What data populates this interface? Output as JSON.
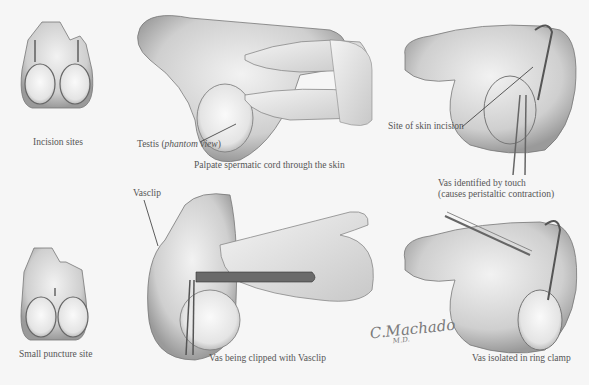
{
  "figure": {
    "panels": [
      {
        "id": "incision-sites",
        "caption": "Incision sites"
      },
      {
        "id": "palpate",
        "caption": "Palpate spermatic cord through the skin",
        "callout": {
          "text_prefix": "Testis (",
          "text_italic": "phantom view",
          "text_suffix": ")"
        }
      },
      {
        "id": "vas-identified",
        "caption_line1": "Vas identified by touch",
        "caption_line2": "(causes peristaltic contraction)",
        "callout": "Site of skin incision"
      },
      {
        "id": "small-puncture",
        "caption": "Small puncture site"
      },
      {
        "id": "vas-clipped",
        "caption": "Vas being clipped with Vasclip",
        "callout": "Vasclip"
      },
      {
        "id": "ring-clamp",
        "caption": "Vas isolated in ring clamp"
      }
    ],
    "signature": {
      "name": "C.Machado",
      "suffix": "M.D."
    }
  }
}
